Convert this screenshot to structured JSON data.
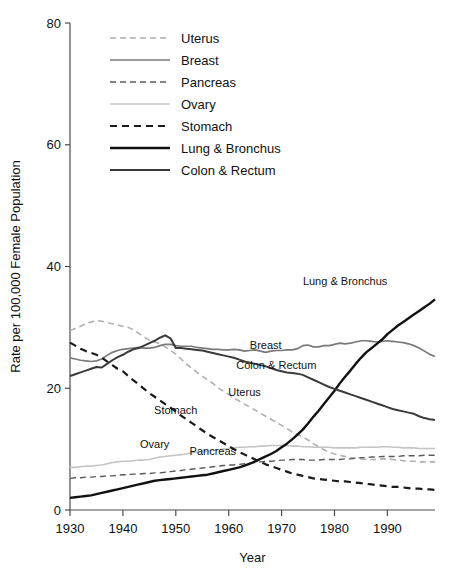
{
  "chart_data": {
    "type": "line",
    "title": "",
    "xlabel": "Year",
    "ylabel": "Rate per 100,000 Female Population",
    "xlim": [
      1930,
      1999
    ],
    "ylim": [
      0,
      80
    ],
    "xticks": [
      1930,
      1940,
      1950,
      1960,
      1970,
      1980,
      1990
    ],
    "yticks": [
      0,
      20,
      40,
      60,
      80
    ],
    "grid": false,
    "legend_position": "top-left-inside",
    "x": [
      1930,
      1931,
      1932,
      1933,
      1934,
      1935,
      1936,
      1937,
      1938,
      1939,
      1940,
      1941,
      1942,
      1943,
      1944,
      1945,
      1946,
      1947,
      1948,
      1949,
      1950,
      1951,
      1952,
      1953,
      1954,
      1955,
      1956,
      1957,
      1958,
      1959,
      1960,
      1961,
      1962,
      1963,
      1964,
      1965,
      1966,
      1967,
      1968,
      1969,
      1970,
      1971,
      1972,
      1973,
      1974,
      1975,
      1976,
      1977,
      1978,
      1979,
      1980,
      1981,
      1982,
      1983,
      1984,
      1985,
      1986,
      1987,
      1988,
      1989,
      1990,
      1991,
      1992,
      1993,
      1994,
      1995,
      1996,
      1997,
      1998,
      1999
    ],
    "series": [
      {
        "name": "Uterus",
        "color": "#b0b0b0",
        "dash": "6,4",
        "width": 1.6,
        "label_xy": [
          1963,
          18.8
        ],
        "values": [
          29.5,
          29.8,
          30.2,
          30.6,
          30.9,
          31.1,
          31.0,
          30.8,
          30.6,
          30.4,
          30.2,
          30.0,
          29.6,
          29.0,
          28.4,
          27.9,
          27.6,
          27.3,
          26.8,
          26.2,
          25.6,
          24.8,
          24.0,
          23.3,
          22.6,
          22.0,
          21.4,
          20.8,
          20.1,
          19.5,
          19.0,
          18.4,
          17.9,
          17.4,
          16.9,
          16.4,
          15.9,
          15.4,
          14.9,
          14.4,
          13.9,
          13.4,
          12.8,
          12.4,
          12.0,
          11.5,
          10.9,
          10.4,
          9.9,
          9.5,
          9.2,
          9.0,
          8.8,
          8.6,
          8.5,
          8.4,
          8.3,
          8.3,
          8.3,
          8.4,
          8.4,
          8.3,
          8.2,
          8.1,
          8.0,
          8.0,
          7.9,
          7.9,
          7.9,
          7.9
        ]
      },
      {
        "name": "Breast",
        "color": "#7a7a7a",
        "dash": "",
        "width": 1.7,
        "label_xy": [
          1967,
          26.5
        ],
        "values": [
          25.0,
          24.8,
          24.6,
          24.5,
          24.4,
          24.5,
          24.8,
          25.4,
          25.9,
          26.2,
          26.4,
          26.5,
          26.6,
          26.7,
          26.6,
          26.6,
          26.7,
          27.0,
          27.2,
          27.2,
          27.0,
          26.9,
          26.9,
          26.9,
          26.7,
          26.6,
          26.5,
          26.4,
          26.4,
          26.3,
          26.3,
          26.4,
          26.3,
          26.1,
          26.2,
          26.3,
          26.1,
          25.9,
          26.1,
          26.2,
          26.2,
          26.3,
          26.3,
          26.5,
          27.0,
          27.1,
          26.8,
          26.8,
          27.0,
          27.0,
          27.2,
          27.4,
          27.3,
          27.4,
          27.6,
          27.8,
          27.8,
          27.7,
          27.6,
          27.7,
          27.8,
          27.7,
          27.6,
          27.5,
          27.3,
          27.0,
          26.6,
          26.1,
          25.6,
          25.2
        ]
      },
      {
        "name": "Pancreas",
        "color": "#5a5a5a",
        "dash": "6,4",
        "width": 1.4,
        "label_xy": [
          1957,
          9.0
        ],
        "values": [
          5.2,
          5.3,
          5.3,
          5.4,
          5.4,
          5.5,
          5.5,
          5.6,
          5.6,
          5.7,
          5.8,
          5.8,
          5.9,
          5.9,
          6.0,
          6.0,
          6.1,
          6.1,
          6.2,
          6.3,
          6.4,
          6.5,
          6.6,
          6.7,
          6.8,
          6.9,
          7.0,
          7.1,
          7.2,
          7.3,
          7.4,
          7.4,
          7.5,
          7.6,
          7.7,
          7.8,
          7.9,
          8.0,
          8.0,
          8.1,
          8.2,
          8.2,
          8.3,
          8.3,
          8.3,
          8.2,
          8.2,
          8.2,
          8.3,
          8.3,
          8.3,
          8.3,
          8.4,
          8.4,
          8.5,
          8.6,
          8.6,
          8.7,
          8.7,
          8.8,
          8.8,
          8.8,
          8.8,
          8.9,
          8.9,
          8.9,
          8.9,
          9.0,
          9.0,
          9.0
        ]
      },
      {
        "name": "Ovary",
        "color": "#c4c4c4",
        "dash": "",
        "width": 1.6,
        "label_xy": [
          1946,
          10.2
        ],
        "values": [
          7.0,
          7.0,
          7.1,
          7.2,
          7.2,
          7.3,
          7.4,
          7.6,
          7.8,
          7.9,
          8.0,
          8.0,
          8.1,
          8.2,
          8.2,
          8.3,
          8.5,
          8.7,
          8.8,
          8.9,
          9.0,
          9.1,
          9.2,
          9.4,
          9.5,
          9.6,
          9.7,
          9.8,
          9.9,
          10.0,
          10.1,
          10.2,
          10.3,
          10.3,
          10.4,
          10.4,
          10.5,
          10.5,
          10.6,
          10.6,
          10.6,
          10.6,
          10.5,
          10.5,
          10.4,
          10.4,
          10.3,
          10.3,
          10.3,
          10.3,
          10.2,
          10.2,
          10.2,
          10.2,
          10.2,
          10.3,
          10.3,
          10.3,
          10.3,
          10.4,
          10.4,
          10.3,
          10.3,
          10.2,
          10.2,
          10.2,
          10.1,
          10.1,
          10.1,
          10.1
        ]
      },
      {
        "name": "Stomach",
        "color": "#1a1a1a",
        "dash": "7,5",
        "width": 2.2,
        "label_xy": [
          1950,
          15.8
        ],
        "values": [
          27.5,
          27.0,
          26.5,
          26.1,
          25.8,
          25.5,
          25.0,
          24.4,
          23.8,
          23.2,
          22.8,
          22.0,
          21.3,
          20.6,
          19.9,
          19.2,
          18.6,
          18.0,
          17.4,
          16.8,
          16.2,
          15.5,
          14.9,
          14.3,
          13.7,
          13.1,
          12.5,
          12.0,
          11.5,
          11.0,
          10.5,
          10.0,
          9.5,
          9.1,
          8.7,
          8.3,
          7.9,
          7.5,
          7.2,
          6.9,
          6.6,
          6.3,
          6.0,
          5.8,
          5.6,
          5.4,
          5.2,
          5.1,
          5.0,
          4.9,
          4.8,
          4.7,
          4.7,
          4.6,
          4.5,
          4.4,
          4.3,
          4.2,
          4.1,
          4.0,
          3.9,
          3.8,
          3.8,
          3.7,
          3.6,
          3.5,
          3.5,
          3.4,
          3.4,
          3.3
        ]
      },
      {
        "name": "Lung & Bronchus",
        "color": "#111111",
        "dash": "",
        "width": 2.4,
        "label_xy": [
          1982,
          37.0
        ],
        "values": [
          2.0,
          2.1,
          2.2,
          2.3,
          2.4,
          2.6,
          2.8,
          3.0,
          3.2,
          3.4,
          3.6,
          3.8,
          4.0,
          4.2,
          4.4,
          4.6,
          4.8,
          4.9,
          5.0,
          5.1,
          5.2,
          5.3,
          5.4,
          5.5,
          5.6,
          5.7,
          5.8,
          6.0,
          6.2,
          6.4,
          6.6,
          6.8,
          7.0,
          7.3,
          7.6,
          8.0,
          8.4,
          8.8,
          9.2,
          9.7,
          10.3,
          10.9,
          11.6,
          12.4,
          13.2,
          14.2,
          15.3,
          16.3,
          17.4,
          18.5,
          19.6,
          20.8,
          21.9,
          22.9,
          24.0,
          25.0,
          25.9,
          26.6,
          27.3,
          28.0,
          28.9,
          29.6,
          30.3,
          30.9,
          31.5,
          32.1,
          32.7,
          33.3,
          33.9,
          34.6
        ]
      },
      {
        "name": "Colon & Rectum",
        "color": "#3a3a3a",
        "dash": "",
        "width": 2.0,
        "label_xy": [
          1969,
          23.2
        ],
        "values": [
          22.0,
          22.3,
          22.6,
          22.9,
          23.2,
          23.5,
          23.4,
          24.0,
          24.6,
          25.1,
          25.5,
          26.0,
          26.4,
          26.6,
          27.0,
          27.4,
          27.8,
          28.3,
          28.7,
          28.2,
          26.6,
          26.6,
          26.5,
          26.4,
          26.3,
          26.2,
          26.0,
          25.8,
          25.6,
          25.4,
          25.2,
          25.0,
          24.7,
          24.4,
          24.2,
          24.0,
          23.8,
          23.6,
          23.3,
          23.0,
          22.8,
          22.6,
          22.5,
          22.4,
          22.2,
          21.8,
          21.4,
          21.0,
          20.6,
          20.2,
          19.9,
          19.6,
          19.3,
          19.0,
          18.7,
          18.4,
          18.1,
          17.8,
          17.5,
          17.2,
          16.9,
          16.6,
          16.4,
          16.2,
          16.0,
          15.8,
          15.4,
          15.1,
          14.9,
          14.8
        ]
      }
    ],
    "legend_entries": [
      {
        "label": "Uterus",
        "color": "#b0b0b0",
        "dash": "6,4",
        "width": 1.6
      },
      {
        "label": "Breast",
        "color": "#7a7a7a",
        "dash": "",
        "width": 1.7
      },
      {
        "label": "Pancreas",
        "color": "#5a5a5a",
        "dash": "6,4",
        "width": 1.4
      },
      {
        "label": "Ovary",
        "color": "#c4c4c4",
        "dash": "",
        "width": 1.6
      },
      {
        "label": "Stomach",
        "color": "#1a1a1a",
        "dash": "7,5",
        "width": 2.2
      },
      {
        "label": "Lung & Bronchus",
        "color": "#111111",
        "dash": "",
        "width": 2.4
      },
      {
        "label": "Colon & Rectum",
        "color": "#3a3a3a",
        "dash": "",
        "width": 2.0
      }
    ]
  },
  "axes": {
    "x_tick_labels": [
      "1930",
      "1940",
      "1950",
      "1960",
      "1970",
      "1980",
      "1990"
    ],
    "y_tick_labels": [
      "0",
      "20",
      "40",
      "60",
      "80"
    ],
    "x_title": "Year",
    "y_title": "Rate per 100,000 Female Population"
  }
}
